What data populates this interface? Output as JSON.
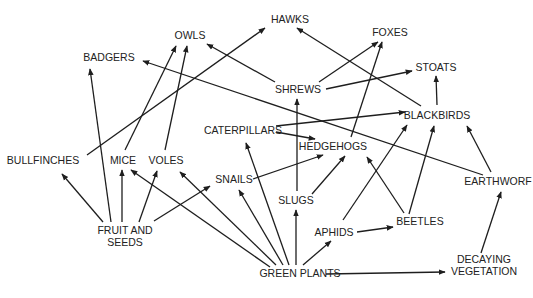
{
  "diagram": {
    "type": "food-web",
    "colors": {
      "line": "#1e1e1e",
      "text": "#222222",
      "background": "#ffffff"
    },
    "nodes": [
      {
        "id": "hawks",
        "label": "HAWKS",
        "x": 290,
        "y": 19
      },
      {
        "id": "foxes",
        "label": "FOXES",
        "x": 390,
        "y": 32
      },
      {
        "id": "owls",
        "label": "OWLS",
        "x": 190,
        "y": 35
      },
      {
        "id": "badgers",
        "label": "BADGERS",
        "x": 109,
        "y": 57
      },
      {
        "id": "stoats",
        "label": "STOATS",
        "x": 436,
        "y": 67
      },
      {
        "id": "shrews",
        "label": "SHREWS",
        "x": 298,
        "y": 89
      },
      {
        "id": "blackbirds",
        "label": "BLACKBIRDS",
        "x": 437,
        "y": 115
      },
      {
        "id": "caterpillars",
        "label": "CATERPILLARS",
        "x": 243,
        "y": 130
      },
      {
        "id": "hedgehogs",
        "label": "HEDGEHOGS",
        "x": 333,
        "y": 146
      },
      {
        "id": "bullfinches",
        "label": "BULLFINCHES",
        "x": 43,
        "y": 160
      },
      {
        "id": "mice",
        "label": "MICE",
        "x": 123,
        "y": 160
      },
      {
        "id": "voles",
        "label": "VOLES",
        "x": 166,
        "y": 160
      },
      {
        "id": "snails",
        "label": "SNAILS",
        "x": 234,
        "y": 179
      },
      {
        "id": "earthworms",
        "label": "EARTHWORF",
        "x": 498,
        "y": 181
      },
      {
        "id": "slugs",
        "label": "SLUGS",
        "x": 296,
        "y": 200
      },
      {
        "id": "fruit_seeds",
        "label": "FRUIT AND\nSEEDS",
        "x": 125,
        "y": 236
      },
      {
        "id": "beetles",
        "label": "BEETLES",
        "x": 420,
        "y": 221
      },
      {
        "id": "aphids",
        "label": "APHIDS",
        "x": 334,
        "y": 232
      },
      {
        "id": "green_plants",
        "label": "GREEN PLANTS",
        "x": 300,
        "y": 273
      },
      {
        "id": "decaying_vegetation",
        "label": "DECAYING\nVEGETATION",
        "x": 484,
        "y": 265
      }
    ],
    "edges": [
      {
        "from": "fruit_seeds",
        "to": "bullfinches",
        "x1": 103,
        "y1": 222,
        "x2": 62,
        "y2": 174
      },
      {
        "from": "fruit_seeds",
        "to": "badgers",
        "x1": 111,
        "y1": 222,
        "x2": 90,
        "y2": 69
      },
      {
        "from": "fruit_seeds",
        "to": "mice",
        "x1": 122,
        "y1": 222,
        "x2": 122,
        "y2": 170
      },
      {
        "from": "fruit_seeds",
        "to": "voles",
        "x1": 139,
        "y1": 222,
        "x2": 157,
        "y2": 171
      },
      {
        "from": "fruit_seeds",
        "to": "snails",
        "x1": 154,
        "y1": 221,
        "x2": 210,
        "y2": 186
      },
      {
        "from": "bullfinches",
        "to": "hawks",
        "x1": 87,
        "y1": 155,
        "x2": 265,
        "y2": 28
      },
      {
        "from": "mice",
        "to": "owls",
        "x1": 125,
        "y1": 150,
        "x2": 176,
        "y2": 46
      },
      {
        "from": "voles",
        "to": "owls",
        "x1": 165,
        "y1": 150,
        "x2": 187,
        "y2": 46
      },
      {
        "from": "green_plants",
        "to": "mice",
        "x1": 270,
        "y1": 267,
        "x2": 131,
        "y2": 170
      },
      {
        "from": "green_plants",
        "to": "voles",
        "x1": 276,
        "y1": 265,
        "x2": 180,
        "y2": 172
      },
      {
        "from": "green_plants",
        "to": "snails",
        "x1": 283,
        "y1": 265,
        "x2": 239,
        "y2": 190
      },
      {
        "from": "green_plants",
        "to": "caterpillars",
        "x1": 289,
        "y1": 265,
        "x2": 246,
        "y2": 143
      },
      {
        "from": "green_plants",
        "to": "slugs",
        "x1": 296,
        "y1": 265,
        "x2": 296,
        "y2": 210
      },
      {
        "from": "green_plants",
        "to": "aphids",
        "x1": 303,
        "y1": 265,
        "x2": 331,
        "y2": 241
      },
      {
        "from": "green_plants",
        "to": "decaying_vegetation",
        "x1": 326,
        "y1": 274,
        "x2": 445,
        "y2": 272
      },
      {
        "from": "decaying_vegetation",
        "to": "earthworms",
        "x1": 481,
        "y1": 253,
        "x2": 501,
        "y2": 192
      },
      {
        "from": "earthworms",
        "to": "blackbirds",
        "x1": 491,
        "y1": 172,
        "x2": 467,
        "y2": 126
      },
      {
        "from": "earthworms",
        "to": "badgers",
        "x1": 483,
        "y1": 175,
        "x2": 143,
        "y2": 61
      },
      {
        "from": "aphids",
        "to": "beetles",
        "x1": 357,
        "y1": 232,
        "x2": 393,
        "y2": 227
      },
      {
        "from": "aphids",
        "to": "blackbirds",
        "x1": 343,
        "y1": 220,
        "x2": 407,
        "y2": 125
      },
      {
        "from": "beetles",
        "to": "hedgehogs",
        "x1": 404,
        "y1": 213,
        "x2": 367,
        "y2": 157
      },
      {
        "from": "beetles",
        "to": "blackbirds",
        "x1": 409,
        "y1": 214,
        "x2": 434,
        "y2": 126
      },
      {
        "from": "slugs",
        "to": "shrews",
        "x1": 297,
        "y1": 191,
        "x2": 297,
        "y2": 99
      },
      {
        "from": "slugs",
        "to": "hedgehogs",
        "x1": 312,
        "y1": 194,
        "x2": 345,
        "y2": 156
      },
      {
        "from": "snails",
        "to": "hedgehogs",
        "x1": 253,
        "y1": 179,
        "x2": 323,
        "y2": 155
      },
      {
        "from": "caterpillars",
        "to": "hedgehogs",
        "x1": 276,
        "y1": 132,
        "x2": 315,
        "y2": 139
      },
      {
        "from": "caterpillars",
        "to": "blackbirds",
        "x1": 276,
        "y1": 126,
        "x2": 405,
        "y2": 112
      },
      {
        "from": "hedgehogs",
        "to": "foxes",
        "x1": 351,
        "y1": 137,
        "x2": 382,
        "y2": 42
      },
      {
        "from": "shrews",
        "to": "foxes",
        "x1": 319,
        "y1": 82,
        "x2": 378,
        "y2": 42
      },
      {
        "from": "shrews",
        "to": "owls",
        "x1": 275,
        "y1": 82,
        "x2": 207,
        "y2": 44
      },
      {
        "from": "shrews",
        "to": "stoats",
        "x1": 326,
        "y1": 89,
        "x2": 412,
        "y2": 71
      },
      {
        "from": "blackbirds",
        "to": "stoats",
        "x1": 437,
        "y1": 105,
        "x2": 436,
        "y2": 76
      },
      {
        "from": "blackbirds",
        "to": "hawks",
        "x1": 421,
        "y1": 106,
        "x2": 297,
        "y2": 28
      }
    ]
  }
}
